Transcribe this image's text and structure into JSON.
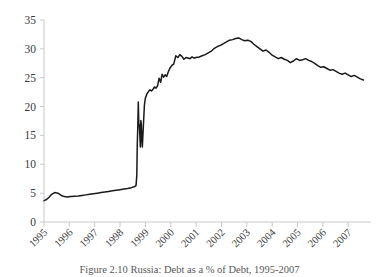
{
  "caption": {
    "text": "Figure 2.10 Russia: Debt as a % of Debt, 1995-2007"
  },
  "chart_data": {
    "type": "line",
    "title": "",
    "subtitle": "",
    "xlabel": "",
    "ylabel": "",
    "grid": false,
    "legend": false,
    "legend_position": "none",
    "line_color": "#1a1a1a",
    "axis_color": "#c9c9c9",
    "ylim": [
      0,
      35
    ],
    "yticks": [
      0,
      5,
      10,
      15,
      20,
      25,
      30,
      35
    ],
    "ytick_labels": [
      "0",
      "5",
      "10",
      "15",
      "20",
      "25",
      "30",
      "35"
    ],
    "xlim": [
      1995,
      2007.9
    ],
    "xticks": [
      1995,
      1996,
      1997,
      1998,
      1999,
      2000,
      2001,
      2002,
      2003,
      2004,
      2005,
      2006,
      2007
    ],
    "xtick_labels": [
      "1995",
      "1996",
      "1997",
      "1998",
      "1999",
      "2000",
      "2001",
      "2002",
      "2003",
      "2004",
      "2005",
      "2006",
      "2007"
    ],
    "xtick_rotation": 45,
    "series": [
      {
        "name": "Russia debt ratio",
        "x": [
          1995.0,
          1995.1,
          1995.2,
          1995.3,
          1995.42,
          1995.55,
          1995.68,
          1995.8,
          1995.92,
          1996.05,
          1996.2,
          1996.35,
          1996.5,
          1996.65,
          1996.8,
          1996.95,
          1997.1,
          1997.25,
          1997.4,
          1997.55,
          1997.7,
          1997.85,
          1998.0,
          1998.15,
          1998.3,
          1998.45,
          1998.55,
          1998.6,
          1998.63,
          1998.66,
          1998.68,
          1998.7,
          1998.72,
          1998.74,
          1998.76,
          1998.78,
          1998.8,
          1998.82,
          1998.84,
          1998.86,
          1998.88,
          1998.9,
          1998.93,
          1998.96,
          1999.0,
          1999.06,
          1999.12,
          1999.18,
          1999.24,
          1999.3,
          1999.36,
          1999.42,
          1999.48,
          1999.54,
          1999.6,
          1999.66,
          1999.72,
          1999.78,
          1999.84,
          1999.9,
          1999.96,
          2000.04,
          2000.12,
          2000.2,
          2000.28,
          2000.36,
          2000.44,
          2000.52,
          2000.6,
          2000.68,
          2000.76,
          2000.84,
          2000.92,
          2001.0,
          2001.12,
          2001.24,
          2001.36,
          2001.48,
          2001.6,
          2001.72,
          2001.84,
          2001.96,
          2002.08,
          2002.2,
          2002.32,
          2002.44,
          2002.56,
          2002.68,
          2002.8,
          2002.92,
          2003.04,
          2003.16,
          2003.28,
          2003.4,
          2003.52,
          2003.64,
          2003.76,
          2003.88,
          2004.0,
          2004.12,
          2004.24,
          2004.36,
          2004.48,
          2004.6,
          2004.72,
          2004.84,
          2004.96,
          2005.08,
          2005.2,
          2005.32,
          2005.44,
          2005.56,
          2005.68,
          2005.8,
          2005.92,
          2006.04,
          2006.16,
          2006.28,
          2006.4,
          2006.52,
          2006.64,
          2006.76,
          2006.88,
          2007.0,
          2007.12,
          2007.24,
          2007.36,
          2007.48,
          2007.6
        ],
        "y": [
          3.7,
          3.9,
          4.3,
          4.8,
          5.1,
          5.0,
          4.6,
          4.4,
          4.35,
          4.4,
          4.45,
          4.5,
          4.6,
          4.7,
          4.8,
          4.9,
          5.0,
          5.1,
          5.2,
          5.3,
          5.4,
          5.5,
          5.6,
          5.7,
          5.8,
          5.95,
          6.1,
          6.2,
          6.3,
          8.0,
          13.5,
          16.5,
          20.8,
          17.0,
          16.8,
          15.2,
          13.0,
          17.6,
          16.9,
          14.2,
          13.0,
          14.8,
          17.5,
          20.2,
          21.5,
          22.2,
          22.6,
          22.9,
          22.7,
          23.0,
          23.4,
          23.2,
          23.6,
          24.9,
          24.2,
          25.6,
          25.1,
          25.5,
          25.2,
          26.0,
          26.6,
          27.1,
          27.4,
          28.8,
          28.5,
          29.0,
          28.7,
          28.2,
          28.5,
          28.4,
          28.3,
          28.6,
          28.4,
          28.5,
          28.6,
          28.8,
          29.0,
          29.3,
          29.6,
          30.1,
          30.4,
          30.6,
          30.9,
          31.2,
          31.5,
          31.6,
          31.8,
          31.9,
          31.6,
          31.4,
          31.5,
          31.3,
          30.8,
          30.4,
          30.0,
          29.6,
          29.8,
          29.4,
          28.9,
          28.6,
          28.3,
          28.5,
          28.2,
          28.0,
          27.6,
          27.9,
          28.3,
          28.0,
          28.1,
          28.3,
          28.0,
          27.8,
          27.5,
          27.1,
          26.8,
          26.9,
          26.6,
          26.3,
          26.4,
          26.1,
          25.8,
          25.6,
          25.8,
          25.5,
          25.2,
          25.4,
          25.1,
          24.8,
          24.6
        ]
      }
    ]
  }
}
